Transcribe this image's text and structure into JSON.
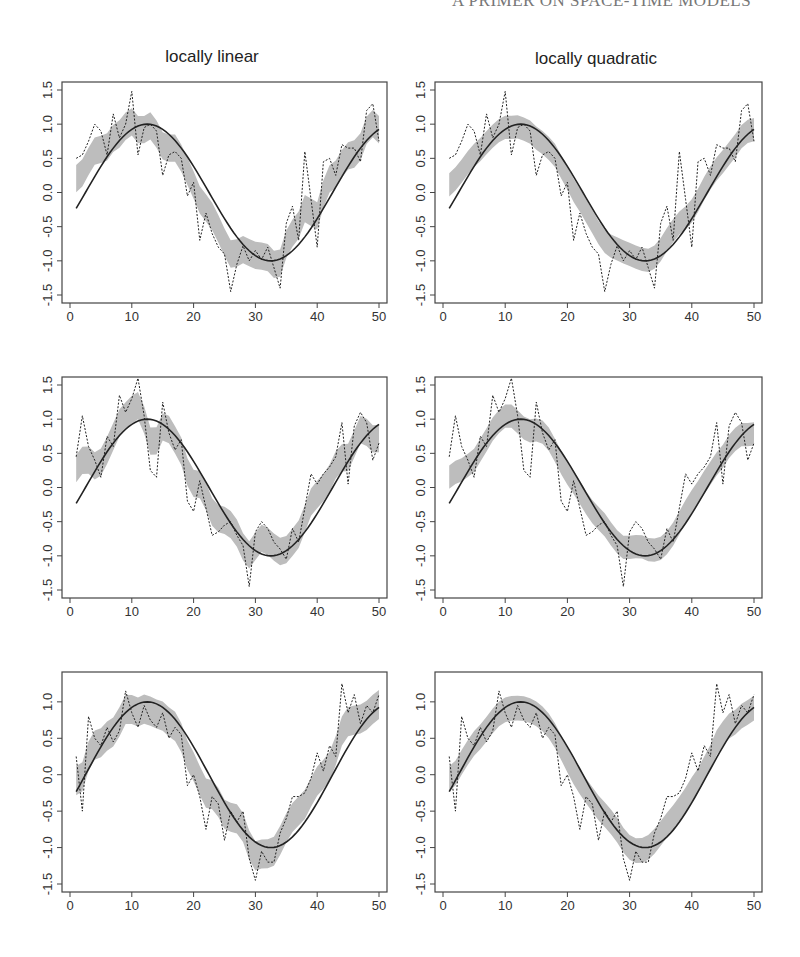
{
  "page": {
    "running_head": "A PRIMER ON SPACE-TIME MODELS",
    "column_titles": [
      "locally linear",
      "locally quadratic"
    ]
  },
  "colors": {
    "band": "#bdbdbd",
    "line": "#222222",
    "frame": "#444444"
  },
  "chart_data": [
    {
      "type": "line",
      "title": "locally linear",
      "row": 1,
      "col": 1,
      "xlabel": "",
      "ylabel": "",
      "xlim": [
        0,
        50
      ],
      "ylim": [
        -1.5,
        1.5
      ],
      "xticks": [
        0,
        10,
        20,
        30,
        40,
        50
      ],
      "yticks": [
        -1.5,
        -1.0,
        -0.5,
        0.0,
        0.5,
        1.0,
        1.5
      ],
      "series": [
        {
          "name": "true function (sine)",
          "style": "solid"
        },
        {
          "name": "observed data",
          "style": "dotted"
        },
        {
          "name": "confidence band",
          "style": "shaded"
        }
      ]
    },
    {
      "type": "line",
      "title": "locally quadratic",
      "row": 1,
      "col": 2,
      "xlim": [
        0,
        50
      ],
      "ylim": [
        -1.5,
        1.5
      ],
      "xticks": [
        0,
        10,
        20,
        30,
        40,
        50
      ],
      "yticks": [
        -1.5,
        -1.0,
        -0.5,
        0.0,
        0.5,
        1.0,
        1.5
      ]
    },
    {
      "type": "line",
      "title": "",
      "row": 2,
      "col": 1,
      "xlim": [
        0,
        50
      ],
      "ylim": [
        -1.5,
        1.5
      ],
      "xticks": [
        0,
        10,
        20,
        30,
        40,
        50
      ],
      "yticks": [
        -1.5,
        -1.0,
        -0.5,
        0.0,
        0.5,
        1.0,
        1.5
      ]
    },
    {
      "type": "line",
      "title": "",
      "row": 2,
      "col": 2,
      "xlim": [
        0,
        50
      ],
      "ylim": [
        -1.5,
        1.5
      ],
      "xticks": [
        0,
        10,
        20,
        30,
        40,
        50
      ],
      "yticks": [
        -1.5,
        -1.0,
        -0.5,
        0.0,
        0.5,
        1.0,
        1.5
      ]
    },
    {
      "type": "line",
      "title": "",
      "row": 3,
      "col": 1,
      "xlim": [
        0,
        50
      ],
      "ylim": [
        -1.5,
        1.3
      ],
      "xticks": [
        0,
        10,
        20,
        30,
        40,
        50
      ],
      "yticks": [
        -1.5,
        -1.0,
        -0.5,
        0.0,
        0.5,
        1.0
      ]
    },
    {
      "type": "line",
      "title": "",
      "row": 3,
      "col": 2,
      "xlim": [
        0,
        50
      ],
      "ylim": [
        -1.5,
        1.3
      ],
      "xticks": [
        0,
        10,
        20,
        30,
        40,
        50
      ],
      "yticks": [
        -1.5,
        -1.0,
        -0.5,
        0.0,
        0.5,
        1.0
      ]
    }
  ],
  "series_data": {
    "x": [
      1,
      2,
      3,
      4,
      5,
      6,
      7,
      8,
      9,
      10,
      11,
      12,
      13,
      14,
      15,
      16,
      17,
      18,
      19,
      20,
      21,
      22,
      23,
      24,
      25,
      26,
      27,
      28,
      29,
      30,
      31,
      32,
      33,
      34,
      35,
      36,
      37,
      38,
      39,
      40,
      41,
      42,
      43,
      44,
      45,
      46,
      47,
      48,
      49,
      50
    ],
    "obs_row1": [
      0.5,
      0.55,
      0.75,
      1.0,
      0.9,
      0.55,
      1.15,
      0.8,
      1.0,
      1.48,
      0.55,
      0.95,
      1.0,
      0.9,
      0.25,
      0.55,
      0.6,
      0.5,
      -0.05,
      0.15,
      -0.7,
      -0.3,
      -0.6,
      -0.8,
      -0.9,
      -1.45,
      -1.05,
      -0.78,
      -1.0,
      -0.85,
      -0.98,
      -0.8,
      -1.1,
      -1.4,
      -0.45,
      -0.2,
      -0.7,
      0.6,
      -0.1,
      -0.8,
      0.45,
      0.5,
      0.25,
      0.7,
      0.65,
      0.65,
      0.45,
      1.2,
      1.3,
      0.75
    ],
    "obs_row2": [
      0.45,
      1.05,
      0.6,
      0.4,
      0.15,
      0.75,
      0.6,
      1.35,
      1.1,
      1.3,
      1.6,
      1.05,
      0.25,
      0.15,
      1.25,
      0.8,
      0.55,
      0.7,
      -0.2,
      -0.35,
      0.1,
      -0.3,
      -0.7,
      -0.65,
      -0.55,
      -0.5,
      -0.7,
      -0.85,
      -1.45,
      -0.65,
      -0.5,
      -0.6,
      -0.8,
      -0.9,
      -1.05,
      -0.6,
      -0.8,
      -0.3,
      0.2,
      0.05,
      0.2,
      0.3,
      0.45,
      0.95,
      0.05,
      0.9,
      1.1,
      0.95,
      0.4,
      0.65
    ],
    "obs_row3": [
      0.25,
      -0.5,
      0.8,
      0.5,
      0.4,
      0.65,
      0.45,
      0.6,
      1.15,
      0.85,
      0.65,
      0.95,
      0.75,
      0.65,
      0.85,
      0.5,
      0.65,
      0.55,
      -0.15,
      0.0,
      -0.3,
      -0.75,
      -0.3,
      -0.4,
      -0.9,
      -0.5,
      -0.65,
      -0.5,
      -1.15,
      -1.45,
      -1.05,
      -1.2,
      -1.2,
      -0.8,
      -0.6,
      -0.3,
      -0.3,
      -0.25,
      -0.05,
      0.3,
      0.05,
      0.4,
      0.25,
      1.25,
      0.85,
      1.1,
      0.7,
      0.95,
      0.85,
      1.1
    ]
  }
}
